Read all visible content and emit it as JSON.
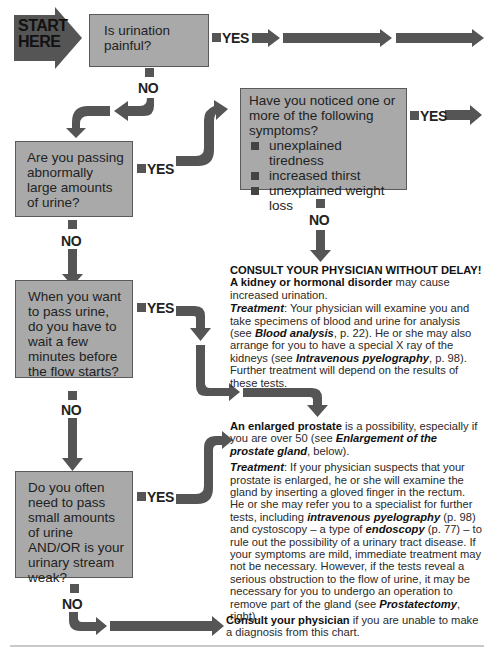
{
  "start": {
    "line1": "START",
    "line2": "HERE"
  },
  "labels": {
    "yes": "YES",
    "no": "NO"
  },
  "colors": {
    "box_fill": "#a9a9a9",
    "arrow_fill": "#555555",
    "text": "#222222"
  },
  "questions": [
    {
      "id": "q1",
      "text": "Is urination painful?"
    },
    {
      "id": "q2",
      "text": "Are you passing abnormally large amounts of urine?"
    },
    {
      "id": "q3",
      "title": "Have you noticed one or more of the following symptoms?",
      "items": [
        "unexplained tiredness",
        "increased thirst",
        "unexplained weight loss"
      ]
    },
    {
      "id": "q4",
      "text": "When you want to pass urine, do you have to wait a few minutes before the flow starts?"
    },
    {
      "id": "q5",
      "text": "Do you often need to pass small amounts of urine AND/OR is your urinary stream weak?"
    }
  ],
  "outcomes": {
    "kidney": {
      "headline": "CONSULT YOUR PHYSICIAN WITHOUT DELAY!",
      "bold": "A kidney or hormonal disorder",
      "rest": " may cause increased urination.",
      "treatment_label": "Treatment",
      "t1": ": Your physician will examine you and take specimens of blood and urine for analysis (see ",
      "t1_ref": "Blood analysis",
      "t2": ", p. 22). He or she may also arrange for you to have a special X ray of the kidneys (see ",
      "t2_ref": "Intravenous pyelography",
      "t3": ", p. 98). Further treatment will depend on the results of these tests."
    },
    "prostate": {
      "bold": "An enlarged prostate",
      "rest": " is a possibility, especially if you are over 50 (see ",
      "ref1": "Enlargement of the prostate gland",
      "rest2": ", below).",
      "treatment_label": "Treatment",
      "t1": ": If your physician suspects that your prostate is enlarged, he or she will examine the gland by inserting a gloved finger in the rectum. He or she may refer you to a specialist for further tests, including ",
      "t1_ref": "intravenous pyelography",
      "t2": " (p. 98) and cystoscopy – a type of ",
      "t2_ref": "endoscopy",
      "t3": " (p. 77) – to rule out the possibility of a urinary tract disease. If your symptoms are mild, immediate treatment may not be necessary. However, if the tests reveal a serious obstruction to the flow of urine, it may be necessary for you to undergo an operation to remove part of the gland (see ",
      "t3_ref": "Prostatectomy",
      "t4": ", right)."
    },
    "consult": {
      "bold": "Consult your physician",
      "rest": " if you are unable to make a diagnosis from this chart."
    }
  }
}
